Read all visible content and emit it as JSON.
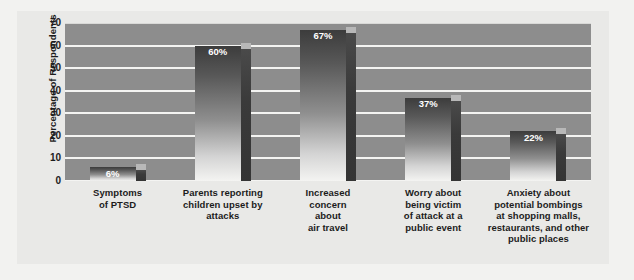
{
  "chart_data": {
    "type": "bar",
    "title": "",
    "subtitle": "",
    "xlabel": "",
    "ylabel": "Percentage of Respondents",
    "ylim": [
      0,
      70
    ],
    "ytick_step": 10,
    "yticks": [
      "70",
      "60",
      "50",
      "40",
      "30",
      "20",
      "10",
      "0"
    ],
    "grid": true,
    "legend": "none",
    "categories": [
      "Symptoms\nof PTSD",
      "Parents reporting\nchildren upset by\nattacks",
      "Increased\nconcern\nabout\nair travel",
      "Worry about\nbeing victim\nof attack at a\npublic event",
      "Anxiety about\npotential bombings\nat shopping malls,\nrestaurants, and other\npublic places"
    ],
    "values": [
      6,
      60,
      67,
      37,
      22
    ],
    "data_labels": [
      "6%",
      "60%",
      "67%",
      "37%",
      "22%"
    ],
    "colors": {
      "plot_background": "#8d8d8d",
      "panel_background": "#e9e9e7",
      "page_background": "#f2f2f0",
      "gridline": "#f4f4f2",
      "bar_face_top": "#3c3c3c",
      "bar_face_bottom": "#f4f4f2",
      "bar_side": "#3a3a3a",
      "label_text": "#1c1c1c",
      "value_text": "#ffffff"
    }
  },
  "category_lines": [
    [
      "Symptoms",
      "of PTSD"
    ],
    [
      "Parents reporting",
      "children upset by",
      "attacks"
    ],
    [
      "Increased",
      "concern",
      "about",
      "air travel"
    ],
    [
      "Worry about",
      "being victim",
      "of attack at a",
      "public event"
    ],
    [
      "Anxiety about",
      "potential bombings",
      "at shopping malls,",
      "restaurants, and other",
      "public places"
    ]
  ]
}
